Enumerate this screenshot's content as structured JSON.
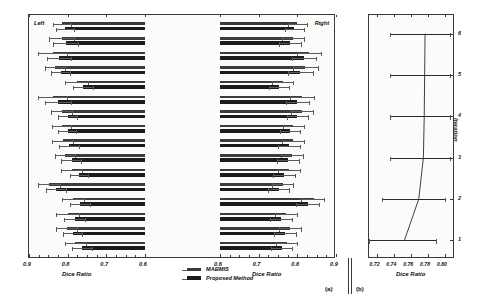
{
  "figure": {
    "panel_a_tag": "(a)",
    "panel_b_tag": "(b)",
    "left_note": "Left",
    "right_note": "Right"
  },
  "legend": {
    "items": [
      {
        "label": "MABMIS",
        "color": "#3c3c3c"
      },
      {
        "label": "Proposed Method",
        "color": "#1b1b1b"
      }
    ]
  },
  "chart_data": [
    {
      "type": "bar",
      "title": "",
      "subtitle": "",
      "panel": "(a)",
      "orientation": "horizontal",
      "xlabel": "Dice Ratio",
      "ylabel": "",
      "grid": false,
      "legend_position": "bottom-center",
      "hemispheres": [
        "Left",
        "Right"
      ],
      "left_axis": {
        "ticks": [
          "0.9",
          "0.8",
          "0.7",
          "0.6"
        ],
        "values": [
          0.9,
          0.8,
          0.7,
          0.6
        ],
        "reversed": true,
        "xlim": [
          0.9,
          0.6
        ]
      },
      "right_axis": {
        "ticks": [
          "0.6",
          "0.7",
          "0.8",
          "0.9"
        ],
        "values": [
          0.6,
          0.7,
          0.8,
          0.9
        ],
        "reversed": false,
        "xlim": [
          0.6,
          0.9
        ]
      },
      "categories": [
        "Occipital Lobe",
        "Cingulate Gyrus",
        "Insula Gyrus",
        "Temporal Pole",
        "Superior Temporal Gyrus",
        "Infero Temporal Region",
        "Parahippocampal Gyrus",
        "Frontal Pole",
        "Superior Frontal Gyrus",
        "Middle Frontal Gyrus",
        "Inferior Gyrus",
        "Orbital Frontal Gyrus",
        "Precentral Gyrus",
        "Superior Parietal Lobule",
        "Inferior Parietal Lobule",
        "Postcentral Gyrus"
      ],
      "series": [
        {
          "name": "MABMIS",
          "hemisphere": "Left",
          "values": [
            0.814,
            0.815,
            0.838,
            0.832,
            0.776,
            0.838,
            0.815,
            0.815,
            0.812,
            0.806,
            0.79,
            0.848,
            0.786,
            0.8,
            0.803,
            0.78
          ],
          "err_low": [
            0.79,
            0.782,
            0.8,
            0.805,
            0.745,
            0.8,
            0.788,
            0.79,
            0.784,
            0.778,
            0.762,
            0.818,
            0.757,
            0.77,
            0.775,
            0.752
          ],
          "err_high": [
            0.838,
            0.848,
            0.876,
            0.859,
            0.807,
            0.876,
            0.842,
            0.84,
            0.84,
            0.834,
            0.818,
            0.878,
            0.815,
            0.83,
            0.831,
            0.808
          ]
        },
        {
          "name": "Proposed Method",
          "hemisphere": "Left",
          "values": [
            0.806,
            0.805,
            0.822,
            0.818,
            0.76,
            0.824,
            0.8,
            0.8,
            0.796,
            0.79,
            0.77,
            0.83,
            0.768,
            0.782,
            0.786,
            0.762
          ],
          "err_low": [
            0.782,
            0.772,
            0.79,
            0.793,
            0.733,
            0.79,
            0.774,
            0.776,
            0.77,
            0.764,
            0.745,
            0.803,
            0.741,
            0.754,
            0.76,
            0.736
          ],
          "err_high": [
            0.83,
            0.838,
            0.854,
            0.843,
            0.787,
            0.858,
            0.826,
            0.824,
            0.822,
            0.816,
            0.795,
            0.857,
            0.795,
            0.81,
            0.812,
            0.788
          ]
        },
        {
          "name": "MABMIS",
          "hemisphere": "Right",
          "values": [
            0.8,
            0.79,
            0.83,
            0.82,
            0.762,
            0.812,
            0.812,
            0.79,
            0.788,
            0.786,
            0.778,
            0.762,
            0.842,
            0.77,
            0.782,
            0.772
          ],
          "err_low": [
            0.776,
            0.76,
            0.798,
            0.788,
            0.735,
            0.782,
            0.784,
            0.764,
            0.76,
            0.758,
            0.75,
            0.735,
            0.81,
            0.742,
            0.752,
            0.744
          ],
          "err_high": [
            0.826,
            0.82,
            0.862,
            0.854,
            0.79,
            0.844,
            0.842,
            0.818,
            0.818,
            0.816,
            0.808,
            0.79,
            0.872,
            0.8,
            0.812,
            0.8
          ]
        },
        {
          "name": "Proposed Method",
          "hemisphere": "Right",
          "values": [
            0.792,
            0.782,
            0.818,
            0.808,
            0.752,
            0.8,
            0.8,
            0.78,
            0.778,
            0.775,
            0.766,
            0.752,
            0.828,
            0.758,
            0.768,
            0.76
          ],
          "err_low": [
            0.768,
            0.752,
            0.786,
            0.776,
            0.726,
            0.77,
            0.772,
            0.754,
            0.75,
            0.747,
            0.738,
            0.724,
            0.796,
            0.73,
            0.74,
            0.732
          ],
          "err_high": [
            0.818,
            0.812,
            0.85,
            0.842,
            0.78,
            0.832,
            0.83,
            0.808,
            0.808,
            0.806,
            0.796,
            0.78,
            0.858,
            0.788,
            0.798,
            0.788
          ]
        }
      ]
    },
    {
      "type": "line",
      "panel": "(b)",
      "title": "",
      "xlabel": "Dice Ratio",
      "ylabel": "Iteration",
      "grid": false,
      "legend_position": "none",
      "xlim": [
        0.71,
        0.812
      ],
      "xticks": [
        "0.72",
        "0.74",
        "0.76",
        "0.78",
        "0.80"
      ],
      "xtick_values": [
        0.72,
        0.74,
        0.76,
        0.78,
        0.8
      ],
      "yticks": [
        "1",
        "2",
        "3",
        "4",
        "5",
        "6"
      ],
      "ytick_values": [
        1,
        2,
        3,
        4,
        5,
        6
      ],
      "x": [
        0.752,
        0.769,
        0.7745,
        0.7755,
        0.776,
        0.7765
      ],
      "y": [
        1,
        2,
        3,
        4,
        5,
        6
      ],
      "err_low": [
        0.7105,
        0.7255,
        0.7345,
        0.7345,
        0.7345,
        0.7345
      ],
      "err_high": [
        0.7905,
        0.8005,
        0.8065,
        0.8065,
        0.8065,
        0.8065
      ]
    }
  ]
}
